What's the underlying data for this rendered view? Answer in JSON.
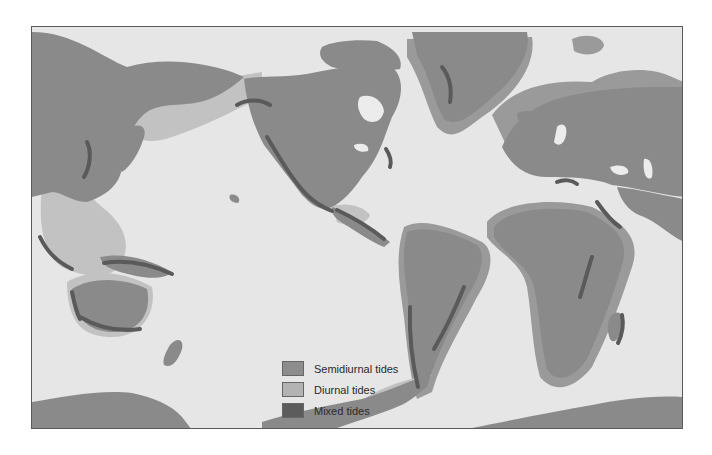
{
  "map": {
    "title": "World distribution of tide types",
    "colors": {
      "ocean": "#e6e6e6",
      "land": "#8a8a8a",
      "semidiurnal": "#9a9a9a",
      "diurnal": "#c2c2c2",
      "mixed": "#5a5a5a",
      "lake": "#ececec"
    }
  },
  "legend": {
    "items": [
      {
        "label": "Semidiurnal tides",
        "key": "semidiurnal",
        "color": "#8d8d8d"
      },
      {
        "label": "Diurnal tides",
        "key": "diurnal",
        "color": "#b3b3b3"
      },
      {
        "label": "Mixed tides",
        "key": "mixed",
        "color": "#5c5c5c"
      }
    ]
  }
}
